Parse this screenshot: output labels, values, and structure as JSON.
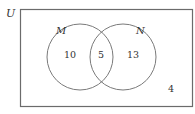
{
  "diagram": {
    "type": "venn",
    "universe_label": "U",
    "sets": [
      {
        "label": "M",
        "only_count": "10"
      },
      {
        "label": "N",
        "only_count": "13"
      }
    ],
    "intersection_count": "5",
    "outside_count": "4",
    "colors": {
      "stroke": "#6b6b6b",
      "text": "#333333"
    }
  }
}
